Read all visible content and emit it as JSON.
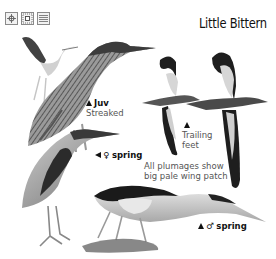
{
  "header": {
    "title": "Little Bittern",
    "icons": [
      "crosshair-icon",
      "dotted-square-icon",
      "horizontal-lines-icon"
    ]
  },
  "labels": {
    "juv": {
      "marker": "up-triangle",
      "title": "Juv",
      "subtitle": "Streaked"
    },
    "flight": {
      "marker": "up-triangle",
      "line1": "Trailing",
      "line2": "feet"
    },
    "female_spring": {
      "marker": "left-triangle",
      "symbol": "♀",
      "title": "spring"
    },
    "wing_note": {
      "line1": "All plumages show",
      "line2": "big pale wing patch"
    },
    "male_spring": {
      "marker": "up-triangle",
      "symbol": "♂",
      "title": "spring"
    }
  },
  "colors": {
    "background": "#ffffff",
    "ink": "#111111",
    "text_gray": "#555555"
  }
}
